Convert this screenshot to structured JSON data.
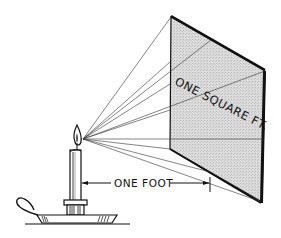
{
  "diagram": {
    "labels": {
      "distance": "ONE FOOT",
      "area": "ONE SQUARE FT."
    },
    "elements": [
      "candle-flame-light-source",
      "candle",
      "candle-holder",
      "illuminated-square-surface",
      "light-rays",
      "distance-dimension-line"
    ],
    "colors": {
      "ink": "#111111",
      "surface_fill": "#d4d4d4",
      "background": "#ffffff"
    }
  }
}
